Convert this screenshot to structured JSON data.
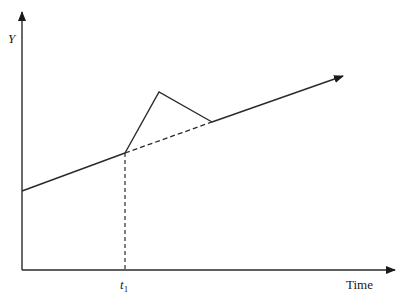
{
  "diagram": {
    "y_axis_label": "Y",
    "x_axis_label": "Time",
    "time_marker": {
      "base": "t",
      "subscript": "1"
    },
    "colors": {
      "stroke": "#2a2a2a",
      "background": "#ffffff"
    },
    "elements": [
      "y-axis with arrow",
      "x-axis (time) with arrow",
      "baseline trend line rising to the right with arrow",
      "dashed vertical marker at t1",
      "dashed continuation of trend after t1",
      "solid deviation: spike up after t1 then return to trend"
    ]
  }
}
